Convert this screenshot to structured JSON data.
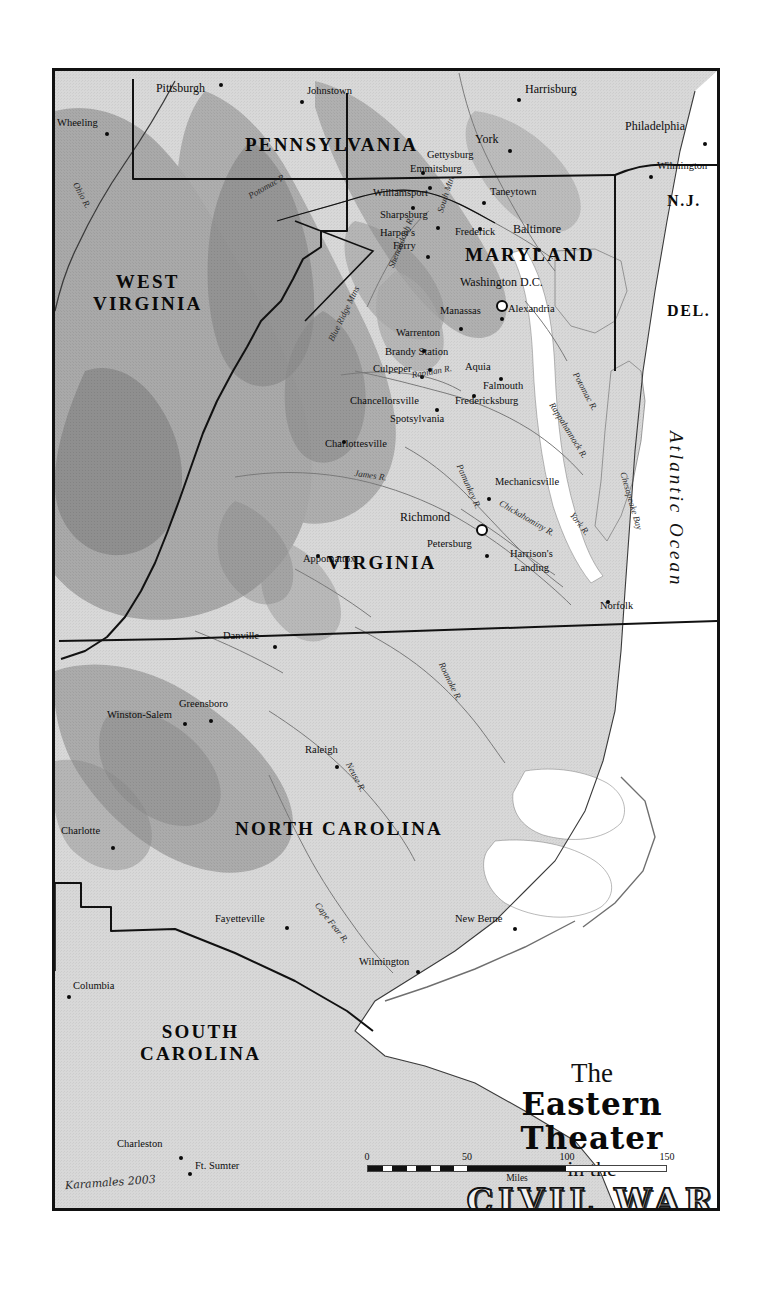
{
  "map": {
    "title": {
      "line1": "The",
      "line2": "Eastern Theater",
      "line3": "in the",
      "line4": "CIVIL WAR"
    },
    "signature": "Karamales 2003",
    "scale": {
      "ticks": [
        "0",
        "50",
        "100",
        "150"
      ],
      "caption": "Miles"
    },
    "ocean_label": "Atlantic Ocean",
    "states": [
      {
        "name": "PENNSYLVANIA",
        "x": 190,
        "y": 64
      },
      {
        "name": "WEST VIRGINIA",
        "x": 38,
        "y": 200,
        "two_line": true
      },
      {
        "name": "MARYLAND",
        "x": 410,
        "y": 174
      },
      {
        "name": "N.J.",
        "x": 612,
        "y": 122
      },
      {
        "name": "DEL.",
        "x": 612,
        "y": 232
      },
      {
        "name": "VIRGINIA",
        "x": 272,
        "y": 482
      },
      {
        "name": "NORTH CAROLINA",
        "x": 180,
        "y": 748
      },
      {
        "name": "SOUTH CAROLINA",
        "x": 85,
        "y": 950,
        "two_line": true
      }
    ],
    "cities": [
      {
        "name": "Pittsburgh",
        "x": 150,
        "y": 11,
        "dx": 0,
        "dy": 0,
        "size": "major",
        "anchor": "end",
        "dot_dx": 14,
        "dot_dy": -8
      },
      {
        "name": "Johnstown",
        "x": 252,
        "y": 15,
        "size": "city",
        "anchor": "start",
        "dot_dx": -7,
        "dot_dy": 5
      },
      {
        "name": "Harrisburg",
        "x": 470,
        "y": 12,
        "size": "major",
        "anchor": "start",
        "dot_dx": -8,
        "dot_dy": 6
      },
      {
        "name": "Philadelphia",
        "x": 570,
        "y": 49,
        "size": "major",
        "anchor": "start",
        "dot_dx": 78,
        "dot_dy": 13
      },
      {
        "name": "Wheeling",
        "x": 2,
        "y": 47,
        "size": "city",
        "anchor": "start",
        "dot_dx": 48,
        "dot_dy": 5
      },
      {
        "name": "York",
        "x": 420,
        "y": 62,
        "size": "major",
        "anchor": "start",
        "dot_dx": 33,
        "dot_dy": 7
      },
      {
        "name": "Gettysburg",
        "x": 372,
        "y": 79,
        "size": "city",
        "anchor": "start",
        "dot_dx": -6,
        "dot_dy": 12
      },
      {
        "name": "Wilmington",
        "x": 602,
        "y": 90,
        "size": "city",
        "anchor": "start",
        "dot_dx": -8,
        "dot_dy": 5
      },
      {
        "name": "Emmitsburg",
        "x": 355,
        "y": 93,
        "size": "city",
        "anchor": "start",
        "dot_dx": 18,
        "dot_dy": 13
      },
      {
        "name": "Williamsport",
        "x": 318,
        "y": 117,
        "size": "city",
        "anchor": "start",
        "dot_dx": 38,
        "dot_dy": 9
      },
      {
        "name": "Taneytown",
        "x": 435,
        "y": 116,
        "size": "city",
        "anchor": "start",
        "dot_dx": -8,
        "dot_dy": 5
      },
      {
        "name": "Sharpsburg",
        "x": 325,
        "y": 139,
        "size": "city",
        "anchor": "start",
        "dot_dx": 56,
        "dot_dy": 7
      },
      {
        "name": "Frederick",
        "x": 400,
        "y": 156,
        "size": "city",
        "anchor": "start",
        "dot_dx": 23,
        "dot_dy": -9
      },
      {
        "name": "Baltimore",
        "x": 458,
        "y": 152,
        "size": "major",
        "anchor": "start",
        "dot_dx": 24,
        "dot_dy": 16
      },
      {
        "name": "Harper's",
        "x": 325,
        "y": 157,
        "size": "city",
        "anchor": "start"
      },
      {
        "name": "Ferry",
        "x": 338,
        "y": 170,
        "size": "city",
        "anchor": "start",
        "dot_dx": 33,
        "dot_dy": 5
      },
      {
        "name": "Washington D.C.",
        "x": 405,
        "y": 205,
        "size": "major",
        "anchor": "start",
        "cap_dx": 36,
        "cap_dy": 15
      },
      {
        "name": "Manassas",
        "x": 385,
        "y": 235,
        "size": "city",
        "anchor": "start",
        "dot_dx": 19,
        "dot_dy": 12
      },
      {
        "name": "Alexandria",
        "x": 453,
        "y": 233,
        "size": "city",
        "anchor": "start",
        "dot_dx": -8,
        "dot_dy": 4
      },
      {
        "name": "Warrenton",
        "x": 341,
        "y": 257,
        "size": "city",
        "anchor": "start",
        "dot_dx": 26,
        "dot_dy": 12
      },
      {
        "name": "Brandy Station",
        "x": 330,
        "y": 276,
        "size": "city",
        "anchor": "start",
        "dot_dx": 43,
        "dot_dy": 12
      },
      {
        "name": "Culpeper",
        "x": 318,
        "y": 293,
        "size": "city",
        "anchor": "start",
        "dot_dx": 47,
        "dot_dy": 2
      },
      {
        "name": "Aquia",
        "x": 410,
        "y": 291,
        "size": "city",
        "anchor": "start",
        "dot_dx": 34,
        "dot_dy": 6
      },
      {
        "name": "Falmouth",
        "x": 428,
        "y": 310,
        "size": "city",
        "anchor": "start",
        "dot_dx": -11,
        "dot_dy": 4
      },
      {
        "name": "Chancellorsville",
        "x": 295,
        "y": 325,
        "size": "city",
        "anchor": "start",
        "dot_dx": 85,
        "dot_dy": 3
      },
      {
        "name": "Fredericksburg",
        "x": 400,
        "y": 325,
        "size": "city",
        "anchor": "start"
      },
      {
        "name": "Spotsylvania",
        "x": 335,
        "y": 343,
        "size": "city",
        "anchor": "start"
      },
      {
        "name": "Charlottesville",
        "x": 270,
        "y": 368,
        "size": "city",
        "anchor": "start",
        "dot_dx": 17,
        "dot_dy": -8
      },
      {
        "name": "Mechanicsville",
        "x": 440,
        "y": 406,
        "size": "city",
        "anchor": "start",
        "dot_dx": -8,
        "dot_dy": 11
      },
      {
        "name": "Richmond",
        "x": 345,
        "y": 440,
        "size": "major",
        "anchor": "start",
        "cap_dx": 76,
        "cap_dy": 4
      },
      {
        "name": "Appomattox",
        "x": 248,
        "y": 483,
        "size": "city",
        "anchor": "start",
        "dot_dx": 13,
        "dot_dy": -9
      },
      {
        "name": "Petersburg",
        "x": 372,
        "y": 468,
        "size": "city",
        "anchor": "start",
        "dot_dx": 58,
        "dot_dy": 6
      },
      {
        "name": "Harrison's",
        "x": 455,
        "y": 478,
        "size": "city",
        "anchor": "start"
      },
      {
        "name": "Landing",
        "x": 459,
        "y": 492,
        "size": "city",
        "anchor": "start"
      },
      {
        "name": "Norfolk",
        "x": 545,
        "y": 530,
        "size": "city",
        "anchor": "start",
        "dot_dx": 6,
        "dot_dy": -10
      },
      {
        "name": "Danville",
        "x": 168,
        "y": 560,
        "size": "city",
        "anchor": "start",
        "dot_dx": 50,
        "dot_dy": 5
      },
      {
        "name": "Greensboro",
        "x": 124,
        "y": 628,
        "size": "city",
        "anchor": "start",
        "dot_dx": 30,
        "dot_dy": 11
      },
      {
        "name": "Winston-Salem",
        "x": 52,
        "y": 639,
        "size": "city",
        "anchor": "start",
        "dot_dx": 76,
        "dot_dy": 3
      },
      {
        "name": "Raleigh",
        "x": 250,
        "y": 674,
        "size": "city",
        "anchor": "start",
        "dot_dx": 30,
        "dot_dy": 11
      },
      {
        "name": "Charlotte",
        "x": 6,
        "y": 755,
        "size": "city",
        "anchor": "start",
        "dot_dx": 50,
        "dot_dy": 11
      },
      {
        "name": "New Berne",
        "x": 400,
        "y": 843,
        "size": "city",
        "anchor": "start",
        "dot_dx": 58,
        "dot_dy": 4
      },
      {
        "name": "Fayetteville",
        "x": 160,
        "y": 843,
        "size": "city",
        "anchor": "start",
        "dot_dx": 70,
        "dot_dy": 3
      },
      {
        "name": "Wilmington",
        "x": 304,
        "y": 886,
        "size": "city",
        "anchor": "start",
        "dot_dx": 57,
        "dot_dy": 4
      },
      {
        "name": "Columbia",
        "x": 18,
        "y": 910,
        "size": "city",
        "anchor": "start",
        "dot_dx": -6,
        "dot_dy": 5
      },
      {
        "name": "Charleston",
        "x": 62,
        "y": 1068,
        "size": "city",
        "anchor": "start",
        "dot_dx": 62,
        "dot_dy": 8
      },
      {
        "name": "Ft. Sumter",
        "x": 140,
        "y": 1090,
        "size": "city",
        "anchor": "start",
        "dot_dx": -7,
        "dot_dy": 2
      }
    ],
    "water_labels": [
      {
        "name": "Ohio R.",
        "x": 24,
        "y": 110,
        "rot": 62
      },
      {
        "name": "Potomac R.",
        "x": 192,
        "y": 122,
        "rot": -30
      },
      {
        "name": "South Mtn",
        "x": 381,
        "y": 140,
        "rot": -72
      },
      {
        "name": "Shenandoah R.",
        "x": 332,
        "y": 195,
        "rot": -68
      },
      {
        "name": "Blue Ridge Mtns",
        "x": 272,
        "y": 268,
        "rot": -64
      },
      {
        "name": "Rapidan R.",
        "x": 356,
        "y": 300,
        "rot": -10
      },
      {
        "name": "Pamunkey R.",
        "x": 408,
        "y": 392,
        "rot": 66
      },
      {
        "name": "Chickahominy R.",
        "x": 447,
        "y": 428,
        "rot": 30
      },
      {
        "name": "Rappahannock R.",
        "x": 500,
        "y": 330,
        "rot": 58
      },
      {
        "name": "Potomac R.",
        "x": 524,
        "y": 300,
        "rot": 62
      },
      {
        "name": "James R.",
        "x": 300,
        "y": 398,
        "rot": 8
      },
      {
        "name": "York R.",
        "x": 520,
        "y": 440,
        "rot": 52
      },
      {
        "name": "Chesapeake Bay",
        "x": 572,
        "y": 400,
        "rot": 74
      },
      {
        "name": "Roanoke R.",
        "x": 390,
        "y": 590,
        "rot": 64
      },
      {
        "name": "Neuse R.",
        "x": 297,
        "y": 690,
        "rot": 62
      },
      {
        "name": "Cape Fear R.",
        "x": 265,
        "y": 830,
        "rot": 52
      }
    ]
  }
}
